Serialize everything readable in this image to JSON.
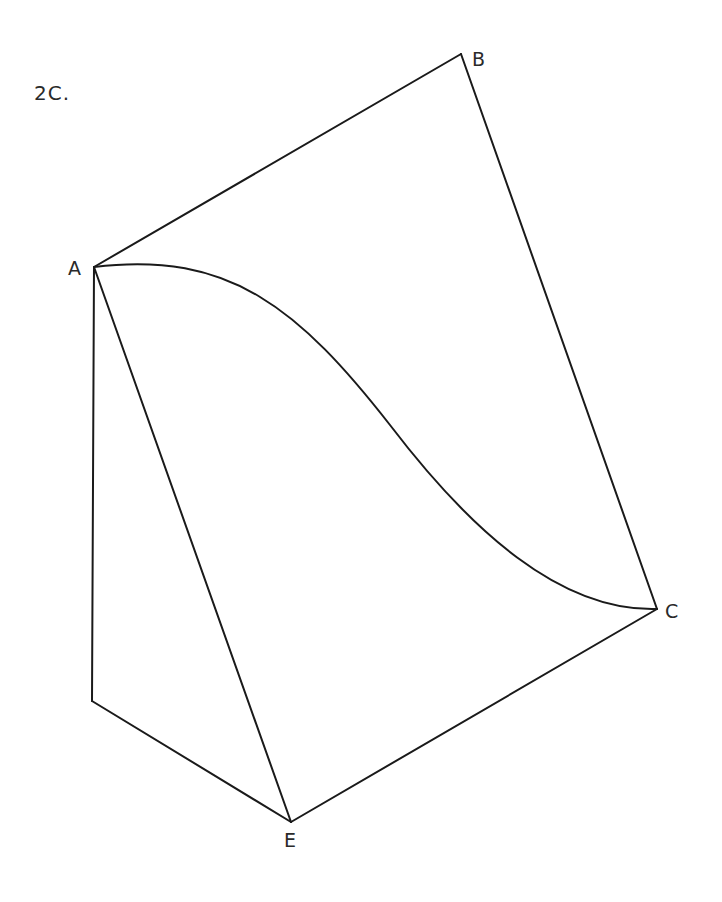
{
  "figure": {
    "title": "2C.",
    "labels": {
      "A": "A",
      "B": "B",
      "C": "C",
      "E": "E"
    },
    "vertices": {
      "A": [
        94,
        267
      ],
      "B": [
        461,
        54
      ],
      "C": [
        657,
        609
      ],
      "E": [
        291,
        822
      ],
      "D_unlabeled": [
        92,
        701
      ]
    },
    "edges": [
      [
        "A",
        "B"
      ],
      [
        "B",
        "C"
      ],
      [
        "C",
        "E"
      ],
      [
        "A",
        "E"
      ],
      [
        "A",
        "D_unlabeled"
      ],
      [
        "D_unlabeled",
        "E"
      ]
    ],
    "curve": {
      "from": "A",
      "to": "C",
      "description": "S-shaped curve from A to C"
    },
    "stroke_color": "#1a1a1a",
    "background_color": "#ffffff"
  }
}
